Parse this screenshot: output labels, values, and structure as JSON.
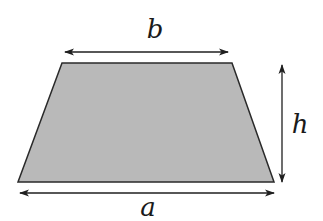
{
  "diagram": {
    "labels": {
      "top_base": "b",
      "bottom_base": "a",
      "height": "h"
    },
    "colors": {
      "fill": "#b9b9b9",
      "stroke": "#2a2a2a",
      "arrow": "#1f1f1f"
    }
  }
}
